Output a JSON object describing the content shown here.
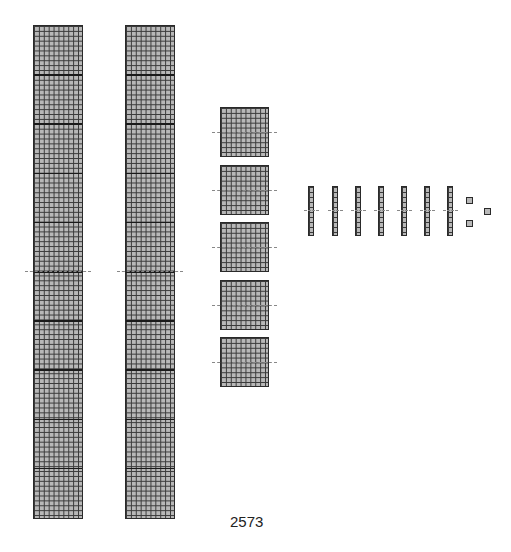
{
  "diagram": {
    "number_label": "2573",
    "thousands": {
      "count": 2,
      "x": [
        33,
        125
      ],
      "y": 25
    },
    "hundreds": {
      "count": 5,
      "x": 220,
      "y": [
        107,
        165,
        222,
        280,
        337
      ]
    },
    "tens": {
      "count": 7,
      "x": [
        308,
        332,
        355,
        378,
        401,
        424,
        447
      ],
      "y": 186
    },
    "ones": {
      "count": 3,
      "positions": [
        [
          466,
          197
        ],
        [
          466,
          220
        ],
        [
          484,
          208
        ]
      ]
    },
    "colors": {
      "fill": "#b8b8b8",
      "grid": "#3a3a3a",
      "divider": "#888888"
    }
  }
}
